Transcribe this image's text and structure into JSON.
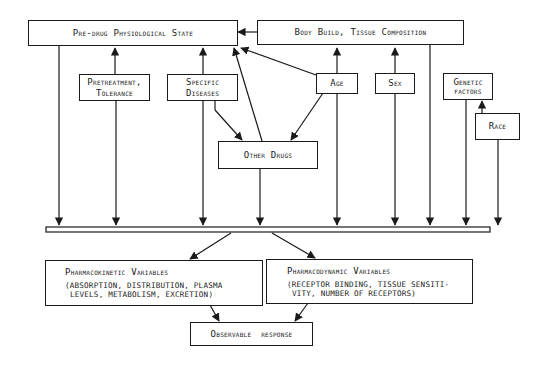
{
  "diagram": {
    "nodes": {
      "pre_drug_state": "Pre-drug Physiological State",
      "body_build": "Body Build, Tissue Composition",
      "pretreatment": [
        "Pretreatment,",
        "Tolerance"
      ],
      "specific_diseases": [
        "Specific",
        "Diseases"
      ],
      "age": "Age",
      "sex": "Sex",
      "genetic_factors": [
        "Genetic",
        "factors"
      ],
      "race": "Race",
      "other_drugs": "Other Drugs",
      "pharmacokinetic": {
        "title": "Pharmacokinetic Variables",
        "detail": [
          "(absorption, distribution, plasma",
          "levels, metabolism, excretion)"
        ]
      },
      "pharmacodynamic": {
        "title": "Pharmacodynamic Variables",
        "detail": [
          "(receptor binding, tissue sensiti-",
          "vity, number of receptors)"
        ]
      },
      "observable_response": "Observable response"
    },
    "edges": [
      {
        "from": "body_build",
        "to": "pre_drug_state"
      },
      {
        "from": "pretreatment",
        "to": "pre_drug_state"
      },
      {
        "from": "specific_diseases",
        "to": "pre_drug_state"
      },
      {
        "from": "other_drugs",
        "to": "pre_drug_state"
      },
      {
        "from": "age",
        "to": "pre_drug_state"
      },
      {
        "from": "age",
        "to": "body_build"
      },
      {
        "from": "sex",
        "to": "body_build"
      },
      {
        "from": "race",
        "to": "genetic_factors"
      },
      {
        "from": "specific_diseases",
        "to": "other_drugs"
      },
      {
        "from": "age",
        "to": "other_drugs"
      },
      {
        "from": "pre_drug_state",
        "to": "convergence_bar"
      },
      {
        "from": "pretreatment",
        "to": "convergence_bar"
      },
      {
        "from": "specific_diseases",
        "to": "convergence_bar"
      },
      {
        "from": "other_drugs",
        "to": "convergence_bar"
      },
      {
        "from": "age",
        "to": "convergence_bar"
      },
      {
        "from": "sex",
        "to": "convergence_bar"
      },
      {
        "from": "body_build",
        "to": "convergence_bar"
      },
      {
        "from": "genetic_factors",
        "to": "convergence_bar"
      },
      {
        "from": "race",
        "to": "convergence_bar"
      },
      {
        "from": "convergence_bar",
        "to": "pharmacokinetic"
      },
      {
        "from": "convergence_bar",
        "to": "pharmacodynamic"
      },
      {
        "from": "pharmacokinetic",
        "to": "observable_response"
      },
      {
        "from": "pharmacodynamic",
        "to": "observable_response"
      }
    ]
  }
}
